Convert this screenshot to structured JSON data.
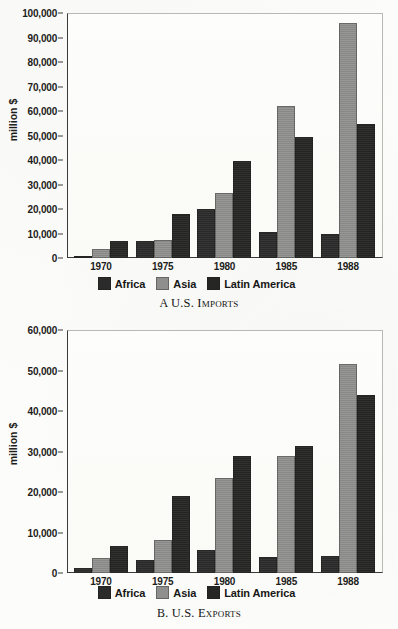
{
  "figure": {
    "panels": [
      {
        "id": "panel-a",
        "caption_prefix": "A",
        "caption_text": "U.S. Imports",
        "ylabel": "million $",
        "yticks": [
          "0",
          "10,000",
          "20,000",
          "30,000",
          "40,000",
          "50,000",
          "60,000",
          "70,000",
          "80,000",
          "90,000",
          "100,000"
        ],
        "xticks": [
          "1970",
          "1975",
          "1980",
          "1985",
          "1988"
        ],
        "legend": [
          {
            "label": "Africa",
            "color": "#2b2b2b"
          },
          {
            "label": "Asia",
            "color": "#8f8f8d"
          },
          {
            "label": "Latin America",
            "color": "#262625"
          }
        ]
      },
      {
        "id": "panel-b",
        "caption_prefix": "B.",
        "caption_text": "U.S. Exports",
        "ylabel": "million $",
        "yticks": [
          "0",
          "10,000",
          "20,000",
          "30,000",
          "40,000",
          "50,000",
          "60,000"
        ],
        "xticks": [
          "1970",
          "1975",
          "1980",
          "1985",
          "1988"
        ],
        "legend": [
          {
            "label": "Africa",
            "color": "#2b2b2b"
          },
          {
            "label": "Asia",
            "color": "#8f8f8d"
          },
          {
            "label": "Latin America",
            "color": "#262625"
          }
        ]
      }
    ]
  },
  "chart_data": [
    {
      "type": "bar",
      "title": "A U.S. Imports",
      "xlabel": "",
      "ylabel": "million $",
      "ylim": [
        0,
        100000
      ],
      "ytick_step": 10000,
      "grid": false,
      "legend_position": "bottom",
      "categories": [
        "1970",
        "1975",
        "1980",
        "1985",
        "1988"
      ],
      "series": [
        {
          "name": "Africa",
          "color": "#2b2b2b",
          "values": [
            1000,
            6800,
            20000,
            10500,
            10000
          ]
        },
        {
          "name": "Asia",
          "color": "#8f8f8d",
          "values": [
            3500,
            7500,
            26500,
            62000,
            96000
          ]
        },
        {
          "name": "Latin America",
          "color": "#262625",
          "values": [
            7000,
            18000,
            39500,
            49500,
            54500
          ]
        }
      ]
    },
    {
      "type": "bar",
      "title": "B. U.S. Exports",
      "xlabel": "",
      "ylabel": "million $",
      "ylim": [
        0,
        60000
      ],
      "ytick_step": 10000,
      "grid": false,
      "legend_position": "bottom",
      "categories": [
        "1970",
        "1975",
        "1980",
        "1985",
        "1988"
      ],
      "series": [
        {
          "name": "Africa",
          "color": "#2b2b2b",
          "values": [
            1200,
            3200,
            5700,
            4000,
            4100
          ]
        },
        {
          "name": "Asia",
          "color": "#8f8f8d",
          "values": [
            3700,
            8100,
            23500,
            28900,
            51700
          ]
        },
        {
          "name": "Latin America",
          "color": "#262625",
          "values": [
            6700,
            19000,
            28800,
            31300,
            44000
          ]
        }
      ]
    }
  ]
}
